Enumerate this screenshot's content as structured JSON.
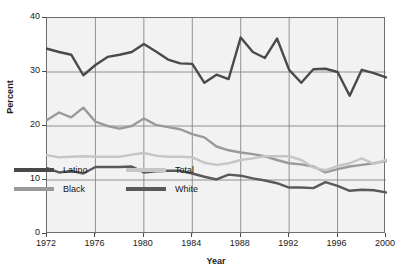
{
  "chart_data": {
    "type": "line",
    "title": "",
    "xlabel": "Year",
    "ylabel": "Percent",
    "xlim": [
      1972,
      2000
    ],
    "ylim": [
      0,
      40
    ],
    "ytick_values": [
      0,
      10,
      20,
      30,
      40
    ],
    "ytick_labels": [
      "0",
      "10",
      "20",
      "30",
      "40"
    ],
    "xtick_values": [
      1972,
      1976,
      1980,
      1984,
      1988,
      1992,
      1996,
      2000
    ],
    "xtick_labels": [
      "1972",
      "1976",
      "1980",
      "1984",
      "1988",
      "1992",
      "1996",
      "2000"
    ],
    "grid": "both",
    "legend_position": "lower-left-inside",
    "x": [
      1972,
      1973,
      1974,
      1975,
      1976,
      1977,
      1978,
      1979,
      1980,
      1981,
      1982,
      1983,
      1984,
      1985,
      1986,
      1987,
      1988,
      1989,
      1990,
      1991,
      1992,
      1993,
      1994,
      1995,
      1996,
      1997,
      1998,
      1999,
      2000
    ],
    "series": [
      {
        "name": "Latino",
        "color": "#4a4a4a",
        "values": [
          34.3,
          33.7,
          33.2,
          29.4,
          31.3,
          32.8,
          33.2,
          33.7,
          35.2,
          33.8,
          32.3,
          31.6,
          31.5,
          28.0,
          29.5,
          28.7,
          36.4,
          33.7,
          32.6,
          36.2,
          30.4,
          28.0,
          30.5,
          30.6,
          30.0,
          25.6,
          30.4,
          29.8,
          29.0
        ]
      },
      {
        "name": "Black",
        "color": "#9a9a9a",
        "values": [
          21.1,
          22.5,
          21.6,
          23.4,
          20.8,
          20.0,
          19.5,
          20.0,
          21.4,
          20.2,
          19.8,
          19.4,
          18.5,
          17.9,
          16.2,
          15.5,
          15.1,
          14.8,
          14.4,
          13.7,
          13.1,
          12.9,
          12.5,
          11.4,
          12.0,
          12.5,
          12.8,
          13.1,
          13.5
        ]
      },
      {
        "name": "Total",
        "color": "#c6c6c6",
        "values": [
          14.6,
          14.2,
          14.3,
          14.4,
          14.3,
          14.3,
          14.3,
          14.7,
          15.0,
          14.5,
          14.3,
          14.3,
          14.2,
          13.2,
          12.8,
          13.1,
          13.7,
          14.0,
          14.4,
          14.4,
          14.4,
          13.7,
          12.3,
          11.8,
          12.6,
          13.1,
          14.0,
          13.0,
          13.7
        ]
      },
      {
        "name": "White",
        "color": "#595959",
        "values": [
          12.2,
          11.4,
          11.7,
          11.2,
          12.4,
          12.4,
          12.4,
          12.5,
          11.4,
          11.6,
          11.7,
          11.7,
          11.2,
          10.6,
          10.1,
          11.0,
          10.8,
          10.3,
          9.9,
          9.4,
          8.6,
          8.6,
          8.5,
          9.6,
          8.9,
          8.0,
          8.2,
          8.1,
          7.7
        ]
      }
    ]
  },
  "legend": {
    "items": [
      {
        "label": "Latino",
        "color": "#4a4a4a"
      },
      {
        "label": "Black",
        "color": "#9a9a9a"
      },
      {
        "label": "Total",
        "color": "#c6c6c6"
      },
      {
        "label": "White",
        "color": "#595959"
      }
    ]
  },
  "colors": {
    "plot_background": "#f2f2f2",
    "grid": "#7a7a7a",
    "axis": "#6e6e6e",
    "text": "#1a1a1a"
  }
}
